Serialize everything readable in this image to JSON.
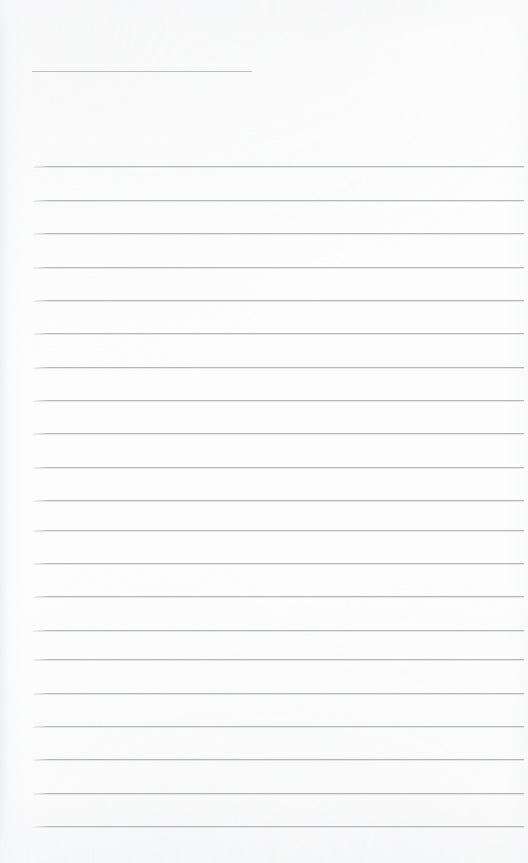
{
  "document": {
    "kind": "lined-paper-scan",
    "title": "Blank Ruled Paper",
    "page_width": 528,
    "page_height": 863,
    "background_color": "#fdfdfd",
    "text_content": "",
    "visible_text": []
  },
  "header_rule": {
    "name": "name-date-blank-rule",
    "x": 32,
    "y": 71,
    "width": 220,
    "color": "#b9bcbf",
    "thickness": 1
  },
  "ruling": {
    "name": "horizontal-ruled-lines",
    "count": 20,
    "first_y": 166,
    "spacing": 33.5,
    "left_x": 33,
    "right_x": 524,
    "color": "#b5b8bb",
    "thickness": 1,
    "lines": [
      {
        "index": 1,
        "y": 166,
        "content": ""
      },
      {
        "index": 2,
        "y": 200,
        "content": ""
      },
      {
        "index": 3,
        "y": 233,
        "content": ""
      },
      {
        "index": 4,
        "y": 267,
        "content": ""
      },
      {
        "index": 5,
        "y": 300,
        "content": ""
      },
      {
        "index": 6,
        "y": 333,
        "content": ""
      },
      {
        "index": 7,
        "y": 367,
        "content": ""
      },
      {
        "index": 8,
        "y": 400,
        "content": ""
      },
      {
        "index": 9,
        "y": 433,
        "content": ""
      },
      {
        "index": 10,
        "y": 467,
        "content": ""
      },
      {
        "index": 11,
        "y": 500,
        "content": ""
      },
      {
        "index": 12,
        "y": 530,
        "content": ""
      },
      {
        "index": 13,
        "y": 563,
        "content": ""
      },
      {
        "index": 14,
        "y": 596,
        "content": ""
      },
      {
        "index": 15,
        "y": 630,
        "content": ""
      },
      {
        "index": 16,
        "y": 659,
        "content": ""
      },
      {
        "index": 17,
        "y": 693,
        "content": ""
      },
      {
        "index": 18,
        "y": 726,
        "content": ""
      },
      {
        "index": 19,
        "y": 759,
        "content": ""
      },
      {
        "index": 20,
        "y": 793,
        "content": ""
      },
      {
        "index": 21,
        "y": 826,
        "content": ""
      }
    ]
  }
}
